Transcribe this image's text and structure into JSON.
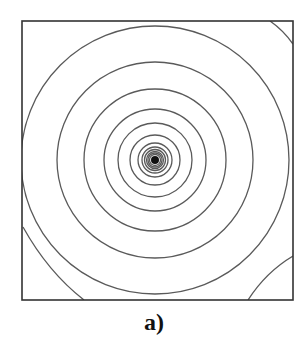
{
  "figure": {
    "label": "a)",
    "frame": {
      "x": 22,
      "y": 21,
      "width": 271,
      "height": 279,
      "stroke": "#333333",
      "stroke_width": 1.6
    },
    "center": {
      "x": 155,
      "y": 160
    },
    "core_disc": {
      "r": 4,
      "fill": "#111111"
    },
    "ring_stroke": "#5a5a5a",
    "ring_stroke_width": 1.3,
    "ring_radii": [
      5.5,
      7,
      8.5,
      10.5,
      13,
      17,
      25,
      37,
      51,
      71,
      98,
      134
    ],
    "corner_arcs": [
      {
        "name": "top-right",
        "d": "M 270 21 Q 283 30 293 44"
      },
      {
        "name": "bottom-right",
        "d": "M 293 256 Q 266 272 248 300"
      },
      {
        "name": "bottom-left",
        "d": "M 23 227 Q 48 272 84 300"
      }
    ]
  }
}
